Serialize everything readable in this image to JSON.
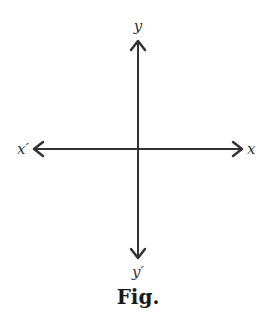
{
  "figure": {
    "caption": "Fig.",
    "line_color": "#333333",
    "axes": {
      "x_positive_label": "x",
      "x_negative_label": "x′",
      "y_positive_label": "y",
      "y_negative_label": "y′"
    }
  }
}
